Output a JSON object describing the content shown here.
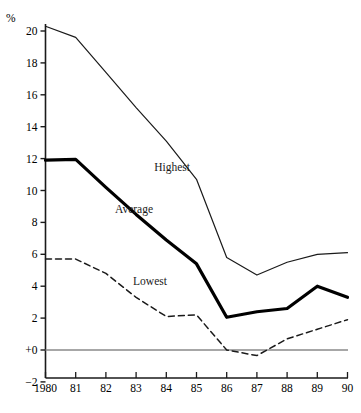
{
  "chart_data": {
    "type": "line",
    "title": "",
    "subtitle": "",
    "xlabel": "",
    "ylabel": "%",
    "x": [
      1980,
      1981,
      1982,
      1983,
      1984,
      1985,
      1986,
      1987,
      1988,
      1989,
      1990
    ],
    "xtick_labels": [
      "1980",
      "81",
      "82",
      "83",
      "84",
      "85",
      "86",
      "87",
      "88",
      "89",
      "90"
    ],
    "ytick_labels": [
      "20",
      "18",
      "16",
      "14",
      "12",
      "10",
      "8",
      "6",
      "4",
      "2",
      "+0",
      "−2"
    ],
    "ytick_values": [
      20,
      18,
      16,
      14,
      12,
      10,
      8,
      6,
      4,
      2,
      0,
      -2
    ],
    "ylim": [
      -2,
      21
    ],
    "xlim": [
      1980,
      1990
    ],
    "grid": false,
    "zero_line": true,
    "legend_position": "inline-annotations",
    "series": [
      {
        "name": "Highest",
        "label": "Highest",
        "style": "solid-thin",
        "color": "#1a1a1a",
        "values": [
          20.3,
          19.6,
          17.4,
          15.2,
          13.1,
          10.7,
          5.8,
          4.7,
          5.5,
          6.0,
          6.1
        ],
        "label_x": 1983.6,
        "label_y": 11.2
      },
      {
        "name": "Average",
        "label": "Average",
        "style": "solid-thick",
        "color": "#000000",
        "values": [
          11.9,
          11.95,
          10.2,
          8.5,
          6.9,
          5.4,
          2.05,
          2.4,
          2.6,
          4.0,
          3.3
        ],
        "label_x": 1982.3,
        "label_y": 8.6
      },
      {
        "name": "Lowest",
        "label": "Lowest",
        "style": "dashed",
        "color": "#1a1a1a",
        "values": [
          5.7,
          5.7,
          4.8,
          3.3,
          2.1,
          2.2,
          0.0,
          -0.35,
          0.7,
          1.3,
          1.9
        ],
        "label_x": 1982.9,
        "label_y": 4.1
      }
    ]
  },
  "axis": {
    "y_unit_label": "%"
  }
}
